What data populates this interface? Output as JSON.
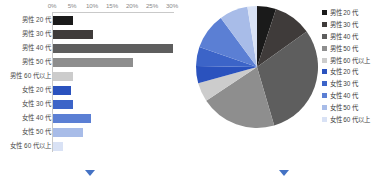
{
  "chart_data": [
    {
      "type": "bar",
      "title": "",
      "xlabel": "",
      "ylabel": "",
      "orientation": "horizontal",
      "xlim": [
        0,
        30
      ],
      "grid": false,
      "tick_labels": [
        "0%",
        "5%",
        "10%",
        "15%",
        "20%",
        "25%",
        "30%"
      ],
      "tick_values": [
        0,
        5,
        10,
        15,
        20,
        25,
        30
      ],
      "categories": [
        "男性 20 代",
        "男性 30 代",
        "男性 40 代",
        "男性 50 代",
        "男性 60 代以上",
        "女性 20 代",
        "女性 30 代",
        "女性 40 代",
        "女性 50 代",
        "女性 60 代以上"
      ],
      "values": [
        5.0,
        10.0,
        30.0,
        20.0,
        5.0,
        4.5,
        5.0,
        9.5,
        7.5,
        2.5
      ],
      "colors": [
        "#1a1a1a",
        "#3f3b3a",
        "#5e5e5e",
        "#8e8e8e",
        "#cccccc",
        "#2a52be",
        "#3c64c8",
        "#5b7fd4",
        "#a8bce8",
        "#d9e2f5"
      ]
    },
    {
      "type": "pie",
      "title": "",
      "legend_position": "right",
      "labels": [
        "男性 20 代",
        "男性 30 代",
        "男性 40 代",
        "男性 50 代",
        "男性 60 代以上",
        "女性 20 代",
        "女性 30 代",
        "女性 40 代",
        "女性 50 代",
        "女性 60 代以上"
      ],
      "values": [
        5.0,
        10.0,
        30.0,
        20.0,
        5.0,
        4.5,
        5.0,
        9.5,
        7.5,
        2.5
      ],
      "colors": [
        "#1a1a1a",
        "#3f3b3a",
        "#5e5e5e",
        "#8e8e8e",
        "#cccccc",
        "#2a52be",
        "#3c64c8",
        "#5b7fd4",
        "#a8bce8",
        "#d9e2f5"
      ]
    }
  ],
  "bar_chart": {
    "axis": {
      "ticks": [
        "0%",
        "5%",
        "10%",
        "15%",
        "20%",
        "25%",
        "30%"
      ]
    },
    "rows": [
      {
        "label": "男性 20 代",
        "value": 5.0,
        "color": "#1a1a1a"
      },
      {
        "label": "男性 30 代",
        "value": 10.0,
        "color": "#3f3b3a"
      },
      {
        "label": "男性 40 代",
        "value": 30.0,
        "color": "#5e5e5e"
      },
      {
        "label": "男性 50 代",
        "value": 20.0,
        "color": "#8e8e8e"
      },
      {
        "label": "男性 60 代以上",
        "value": 5.0,
        "color": "#cccccc"
      },
      {
        "label": "女性 20 代",
        "value": 4.5,
        "color": "#2a52be"
      },
      {
        "label": "女性 30 代",
        "value": 5.0,
        "color": "#3c64c8"
      },
      {
        "label": "女性 40 代",
        "value": 9.5,
        "color": "#5b7fd4"
      },
      {
        "label": "女性 50 代",
        "value": 7.5,
        "color": "#a8bce8"
      },
      {
        "label": "女性 60 代以上",
        "value": 2.5,
        "color": "#d9e2f5"
      }
    ]
  },
  "pie_chart": {
    "legend": [
      {
        "label": "男性 20 代",
        "value": 5.0,
        "color": "#1a1a1a"
      },
      {
        "label": "男性 30 代",
        "value": 10.0,
        "color": "#3f3b3a"
      },
      {
        "label": "男性 40 代",
        "value": 30.0,
        "color": "#5e5e5e"
      },
      {
        "label": "男性 50 代",
        "value": 20.0,
        "color": "#8e8e8e"
      },
      {
        "label": "男性 60 代以上",
        "value": 5.0,
        "color": "#cccccc"
      },
      {
        "label": "女性 20 代",
        "value": 4.5,
        "color": "#2a52be"
      },
      {
        "label": "女性 30 代",
        "value": 5.0,
        "color": "#3c64c8"
      },
      {
        "label": "女性 40 代",
        "value": 9.5,
        "color": "#5b7fd4"
      },
      {
        "label": "女性 50 代",
        "value": 7.5,
        "color": "#a8bce8"
      },
      {
        "label": "女性 60 代以上",
        "value": 2.5,
        "color": "#d9e2f5"
      }
    ]
  },
  "nav": {
    "left_marker": "down-triangle",
    "right_marker": "down-triangle",
    "marker_color": "#4472c4"
  }
}
